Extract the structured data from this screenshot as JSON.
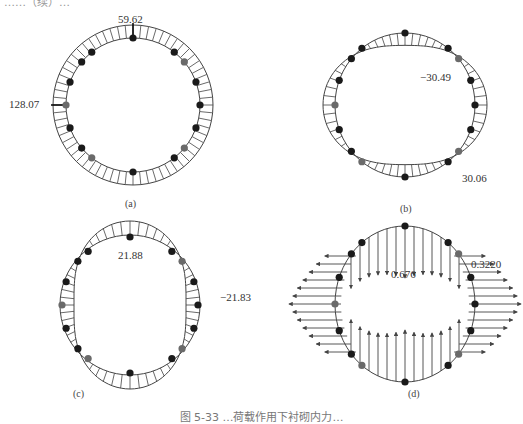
{
  "figure": {
    "top_partial_text": "……（续）…",
    "caption": "图 5-33  …荷载作用下衬砌内力…",
    "panels": [
      {
        "id": "a",
        "label": "(a)",
        "values": {
          "top": "59.62",
          "left": "128.07"
        }
      },
      {
        "id": "b",
        "label": "(b)",
        "values": {
          "upper_right": "−30.49",
          "lower_right": "30.06"
        }
      },
      {
        "id": "c",
        "label": "(c)",
        "values": {
          "top_inner": "21.88",
          "right": "−21.83"
        }
      },
      {
        "id": "d",
        "label": "(d)",
        "values": {
          "top_inner": "0.676",
          "upper_right": "0.3220"
        }
      }
    ]
  },
  "colors": {
    "line": "#444444",
    "node_dark": "#1a1a1a",
    "node_gray": "#6a6a6a",
    "text": "#333333"
  }
}
